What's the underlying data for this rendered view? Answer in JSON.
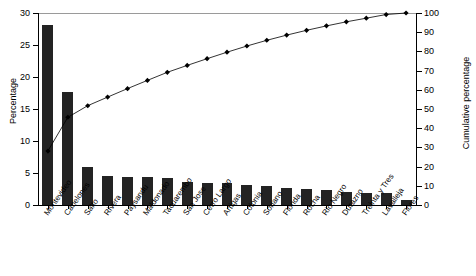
{
  "chart_data": {
    "type": "bar",
    "title": "",
    "subtitle": "",
    "xlabel": "",
    "ylabel": "Percentage",
    "y2label": "Cumulative percentage",
    "ylim": [
      0,
      30
    ],
    "y2lim": [
      0,
      100
    ],
    "yticks": [
      0,
      5,
      10,
      15,
      20,
      25,
      30
    ],
    "y2ticks": [
      0,
      10,
      20,
      30,
      40,
      50,
      60,
      70,
      80,
      90,
      100
    ],
    "grid": false,
    "legend": "none",
    "categories": [
      "Montevideo",
      "Canelones",
      "Salto",
      "Rivera",
      "Paysandu",
      "Maldonado",
      "Tacuarembo",
      "San Jose",
      "Cerro Largo",
      "Artigas",
      "Colonia",
      "Soriano",
      "Florida",
      "Rocha",
      "Rio Negro",
      "Durazno",
      "Treinta y Tres",
      "Lavalleja",
      "Flores"
    ],
    "series": [
      {
        "name": "Percentage",
        "type": "bar",
        "axis": "left",
        "color": "#232323",
        "values": [
          28.1,
          17.6,
          6.0,
          4.5,
          4.4,
          4.3,
          4.2,
          3.6,
          3.5,
          3.4,
          3.2,
          3.0,
          2.7,
          2.5,
          2.3,
          2.1,
          1.9,
          1.9,
          0.8
        ]
      },
      {
        "name": "Cumulative percentage",
        "type": "line",
        "axis": "right",
        "color": "#000000",
        "marker": "diamond",
        "values": [
          28.1,
          45.7,
          51.7,
          56.2,
          60.6,
          64.9,
          69.1,
          72.7,
          76.2,
          79.6,
          82.8,
          85.8,
          88.5,
          91.0,
          93.3,
          95.4,
          97.3,
          99.2,
          100.0
        ]
      }
    ]
  }
}
